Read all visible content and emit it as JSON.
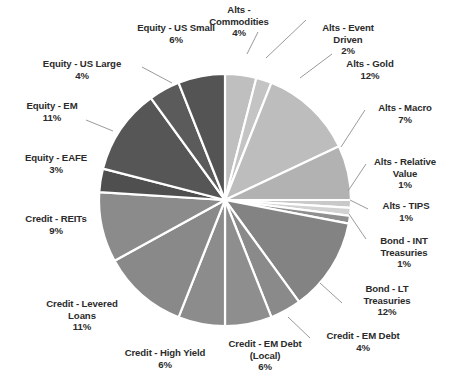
{
  "chart_data": {
    "type": "pie",
    "title": "",
    "subtitle": "",
    "legend_position": "labels-outside",
    "grid": false,
    "start_angle_deg": 0,
    "direction": "clockwise",
    "value_unit": "percent",
    "total": 100,
    "categories": [
      "Alts - Commodities",
      "Alts - Event Driven",
      "Alts - Gold",
      "Alts - Macro",
      "Alts - Relative Value",
      "Alts - TIPS",
      "Bond - INT Treasuries",
      "Bond - LT Treasuries",
      "Credit - EM Debt",
      "Credit - EM Debt (Local)",
      "Credit - High Yield",
      "Credit - Levered Loans",
      "Credit - REITs",
      "Equity - EAFE",
      "Equity - EM",
      "Equity - US Large",
      "Equity - US Small"
    ],
    "values": [
      4,
      2,
      12,
      7,
      1,
      1,
      1,
      12,
      4,
      6,
      6,
      11,
      9,
      3,
      11,
      4,
      6
    ],
    "value_labels": [
      "4%",
      "2%",
      "12%",
      "7%",
      "1%",
      "1%",
      "1%",
      "12%",
      "4%",
      "6%",
      "6%",
      "11%",
      "9%",
      "3%",
      "11%",
      "4%",
      "6%"
    ],
    "colors": [
      "#bfbfbf",
      "#c4c4c4",
      "#bdbdbd",
      "#b2b2b2",
      "#c9c9c9",
      "#d2d2d2",
      "#8f8f8f",
      "#838383",
      "#8a8a8a",
      "#8e8e8e",
      "#8c8c8c",
      "#898989",
      "#8b8b8b",
      "#4f4f4f",
      "#565656",
      "#5b5b5b",
      "#545454"
    ],
    "slices": [
      {
        "label": "Alts - Commodities",
        "value": 4,
        "pct": "4%",
        "color": "#bfbfbf"
      },
      {
        "label": "Alts - Event Driven",
        "value": 2,
        "pct": "2%",
        "color": "#c4c4c4"
      },
      {
        "label": "Alts - Gold",
        "value": 12,
        "pct": "12%",
        "color": "#bdbdbd"
      },
      {
        "label": "Alts - Macro",
        "value": 7,
        "pct": "7%",
        "color": "#b2b2b2"
      },
      {
        "label": "Alts - Relative Value",
        "value": 1,
        "pct": "1%",
        "color": "#c9c9c9"
      },
      {
        "label": "Alts - TIPS",
        "value": 1,
        "pct": "1%",
        "color": "#d2d2d2"
      },
      {
        "label": "Bond - INT Treasuries",
        "value": 1,
        "pct": "1%",
        "color": "#8f8f8f"
      },
      {
        "label": "Bond - LT Treasuries",
        "value": 12,
        "pct": "12%",
        "color": "#838383"
      },
      {
        "label": "Credit - EM Debt",
        "value": 4,
        "pct": "4%",
        "color": "#8a8a8a"
      },
      {
        "label": "Credit - EM Debt (Local)",
        "value": 6,
        "pct": "6%",
        "color": "#8e8e8e"
      },
      {
        "label": "Credit - High Yield",
        "value": 6,
        "pct": "6%",
        "color": "#8c8c8c"
      },
      {
        "label": "Credit - Levered Loans",
        "value": 11,
        "pct": "11%",
        "color": "#898989"
      },
      {
        "label": "Credit - REITs",
        "value": 9,
        "pct": "9%",
        "color": "#8b8b8b"
      },
      {
        "label": "Equity - EAFE",
        "value": 3,
        "pct": "3%",
        "color": "#4f4f4f"
      },
      {
        "label": "Equity - EM",
        "value": 11,
        "pct": "11%",
        "color": "#565656"
      },
      {
        "label": "Equity - US Large",
        "value": 4,
        "pct": "4%",
        "color": "#5b5b5b"
      },
      {
        "label": "Equity - US Small",
        "value": 6,
        "pct": "6%",
        "color": "#545454"
      }
    ]
  },
  "labels": {
    "alts_commodities": "Alts -\nCommodities\n4%",
    "alts_event_driven": "Alts - Event\nDriven\n2%",
    "alts_gold": "Alts - Gold\n12%",
    "alts_macro": "Alts - Macro\n7%",
    "alts_relative_value": "Alts - Relative\nValue\n1%",
    "alts_tips": "Alts - TIPS\n1%",
    "bond_int_treasuries": "Bond - INT\nTreasuries\n1%",
    "bond_lt_treasuries": "Bond - LT\nTreasuries\n12%",
    "credit_em_debt": "Credit - EM Debt\n4%",
    "credit_em_debt_local": "Credit - EM Debt\n(Local)\n6%",
    "credit_high_yield": "Credit - High Yield\n6%",
    "credit_levered_loans": "Credit - Levered\nLoans\n11%",
    "credit_reits": "Credit - REITs\n9%",
    "equity_eafe": "Equity - EAFE\n3%",
    "equity_em": "Equity - EM\n11%",
    "equity_us_large": "Equity - US Large\n4%",
    "equity_us_small": "Equity - US Small\n6%"
  }
}
